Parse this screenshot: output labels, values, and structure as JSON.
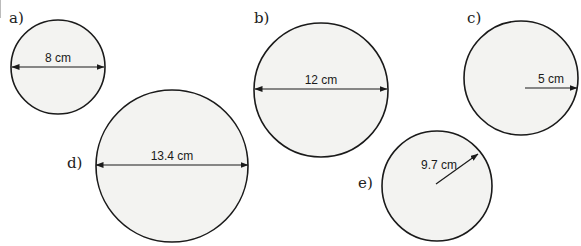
{
  "colors": {
    "circle_fill": "#f3f3f1",
    "circle_stroke": "#1a1a1a",
    "arrow": "#1a1a1a"
  },
  "circles": [
    {
      "label": "a)",
      "measurement": "8 cm",
      "type": "diameter",
      "cx": 58,
      "cy": 67,
      "r": 47
    },
    {
      "label": "b)",
      "measurement": "12 cm",
      "type": "diameter",
      "cx": 321,
      "cy": 90,
      "r": 67
    },
    {
      "label": "c)",
      "measurement": "5 cm",
      "type": "radius",
      "cx": 521,
      "cy": 78,
      "r": 57
    },
    {
      "label": "d)",
      "measurement": "13.4 cm",
      "type": "diameter",
      "cx": 172,
      "cy": 166,
      "r": 76
    },
    {
      "label": "e)",
      "measurement": "9.7 cm",
      "type": "radius",
      "cx": 437,
      "cy": 186,
      "r": 55
    }
  ]
}
